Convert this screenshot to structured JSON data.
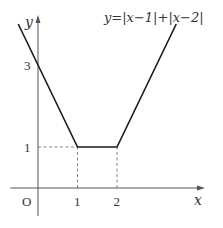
{
  "chart_data": {
    "type": "line",
    "title": "y=|x−1|+|x−2|",
    "xlabel": "x",
    "ylabel": "y",
    "origin_label": "O",
    "xlim": [
      -0.6,
      4.3
    ],
    "ylim": [
      -0.7,
      4.2
    ],
    "grid": false,
    "x_ticks": [
      {
        "value": 1,
        "label": "1"
      },
      {
        "value": 2,
        "label": "2"
      }
    ],
    "y_ticks": [
      {
        "value": 1,
        "label": "1"
      },
      {
        "value": 3,
        "label": "3"
      }
    ],
    "series": [
      {
        "name": "y=|x−1|+|x−2|",
        "points": [
          [
            -0.5,
            4
          ],
          [
            0,
            3
          ],
          [
            1,
            1
          ],
          [
            2,
            1
          ],
          [
            3.5,
            4
          ]
        ]
      }
    ],
    "guides": [
      {
        "type": "dashed",
        "from": [
          0,
          1
        ],
        "to": [
          1,
          1
        ]
      },
      {
        "type": "dashed",
        "from": [
          1,
          0
        ],
        "to": [
          1,
          1
        ]
      },
      {
        "type": "dashed",
        "from": [
          2,
          0
        ],
        "to": [
          2,
          1
        ]
      }
    ],
    "colors": {
      "curve": "#1a1a1a",
      "axis": "#555555",
      "guide": "#777777"
    }
  }
}
